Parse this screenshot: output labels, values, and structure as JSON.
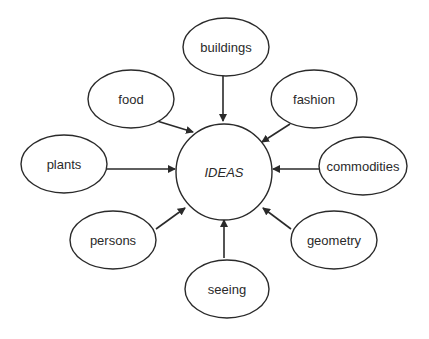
{
  "diagram": {
    "center": {
      "id": "ideas",
      "label": "IDEAS",
      "cx": 224,
      "cy": 172,
      "r": 48
    },
    "nodes": [
      {
        "id": "buildings",
        "label": "buildings",
        "cx": 226,
        "cy": 47,
        "rx": 43,
        "ry": 29
      },
      {
        "id": "food",
        "label": "food",
        "cx": 131,
        "cy": 99,
        "rx": 43,
        "ry": 29
      },
      {
        "id": "fashion",
        "label": "fashion",
        "cx": 314,
        "cy": 99,
        "rx": 43,
        "ry": 29
      },
      {
        "id": "plants",
        "label": "plants",
        "cx": 64,
        "cy": 164,
        "rx": 43,
        "ry": 29
      },
      {
        "id": "commodities",
        "label": "commodities",
        "cx": 363,
        "cy": 166,
        "rx": 44,
        "ry": 29
      },
      {
        "id": "persons",
        "label": "persons",
        "cx": 113,
        "cy": 240,
        "rx": 43,
        "ry": 29
      },
      {
        "id": "geometry",
        "label": "geometry",
        "cx": 334,
        "cy": 240,
        "rx": 43,
        "ry": 29
      },
      {
        "id": "seeing",
        "label": "seeing",
        "cx": 227,
        "cy": 289,
        "rx": 42,
        "ry": 29
      }
    ],
    "edges": [
      {
        "from": "buildings",
        "to": "ideas",
        "x1": 223,
        "y1": 73,
        "x2": 223,
        "y2": 121
      },
      {
        "from": "food",
        "to": "ideas",
        "x1": 157,
        "y1": 121,
        "x2": 193,
        "y2": 132
      },
      {
        "from": "fashion",
        "to": "ideas",
        "x1": 290,
        "y1": 124,
        "x2": 262,
        "y2": 142
      },
      {
        "from": "plants",
        "to": "ideas",
        "x1": 107,
        "y1": 169,
        "x2": 175,
        "y2": 169
      },
      {
        "from": "commodities",
        "to": "ideas",
        "x1": 320,
        "y1": 169,
        "x2": 273,
        "y2": 169
      },
      {
        "from": "persons",
        "to": "ideas",
        "x1": 156,
        "y1": 229,
        "x2": 185,
        "y2": 208
      },
      {
        "from": "geometry",
        "to": "ideas",
        "x1": 291,
        "y1": 229,
        "x2": 263,
        "y2": 208
      },
      {
        "from": "seeing",
        "to": "ideas",
        "x1": 224,
        "y1": 258,
        "x2": 224,
        "y2": 220
      }
    ],
    "colors": {
      "stroke": "#2a2a2a",
      "fill": "#ffffff",
      "background": "#ffffff"
    }
  }
}
